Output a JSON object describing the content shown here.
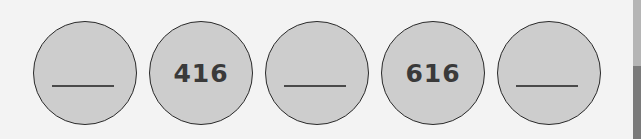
{
  "sequence": {
    "items": [
      {
        "value": "",
        "blank": true
      },
      {
        "value": "416",
        "blank": false
      },
      {
        "value": "",
        "blank": true
      },
      {
        "value": "616",
        "blank": false
      },
      {
        "value": "",
        "blank": true
      }
    ]
  }
}
